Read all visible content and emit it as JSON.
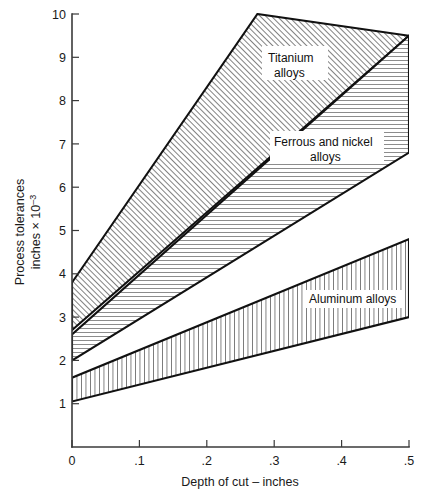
{
  "chart_data": {
    "type": "area",
    "title": "",
    "xlabel": "Depth of cut – inches",
    "ylabel": "Process tolerances inches × 10⁻³",
    "ylabel_line1": "Process tolerances",
    "ylabel_line2": "inches × 10",
    "ylabel_exponent": "–3",
    "xlim": [
      0,
      0.5
    ],
    "ylim": [
      0,
      10
    ],
    "xticks": [
      0,
      0.1,
      0.2,
      0.3,
      0.4,
      0.5
    ],
    "xtick_labels": [
      "0",
      ".1",
      ".2",
      ".3",
      ".4",
      ".5"
    ],
    "yticks": [
      1,
      2,
      3,
      4,
      5,
      6,
      7,
      8,
      9,
      10
    ],
    "ytick_labels": [
      "1",
      "2",
      "3",
      "4",
      "5",
      "6",
      "7",
      "8",
      "9",
      "10"
    ],
    "grid": false,
    "legend": "inline-annotations",
    "bands": [
      {
        "name": "Titanium alloys",
        "label": "Titanium alloys",
        "label_line1": "Titanium",
        "label_line2": "alloys",
        "hatch": "diagonal",
        "hatch_color": "#1a1a1a",
        "fill": "#ffffff",
        "upper_bound": {
          "x": [
            0.0,
            0.275
          ],
          "y": [
            3.8,
            10.0
          ]
        },
        "lower_bound": {
          "x": [
            0.0,
            0.5
          ],
          "y": [
            2.7,
            9.5
          ]
        }
      },
      {
        "name": "Ferrous and nickel alloys",
        "label": "Ferrous and nickel alloys",
        "label_line1": "Ferrous and nickel",
        "label_line2": "alloys",
        "hatch": "horizontal",
        "hatch_color": "#1a1a1a",
        "fill": "#ffffff",
        "upper_bound": {
          "x": [
            0.0,
            0.5
          ],
          "y": [
            2.6,
            9.5
          ]
        },
        "lower_bound": {
          "x": [
            0.0,
            0.5
          ],
          "y": [
            2.0,
            6.8
          ]
        }
      },
      {
        "name": "Aluminum alloys",
        "label": "Aluminum alloys",
        "label_line1": "Aluminum alloys",
        "label_line2": "",
        "hatch": "vertical",
        "hatch_color": "#1a1a1a",
        "fill": "#ffffff",
        "upper_bound": {
          "x": [
            0.0,
            0.5
          ],
          "y": [
            1.6,
            4.8
          ]
        },
        "lower_bound": {
          "x": [
            0.0,
            0.5
          ],
          "y": [
            1.05,
            3.0
          ]
        }
      }
    ]
  }
}
